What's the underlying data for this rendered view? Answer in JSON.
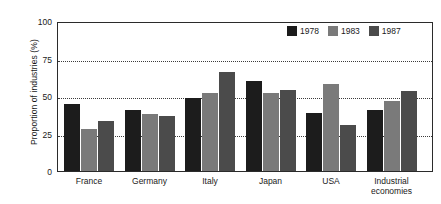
{
  "chart_data": {
    "type": "bar",
    "title": "",
    "xlabel": "",
    "ylabel": "Proportion of industries (%)",
    "ylim": [
      0,
      100
    ],
    "yticks": [
      0,
      25,
      50,
      75,
      100
    ],
    "ytick_labels": [
      "0",
      "25",
      "50",
      "75",
      "100"
    ],
    "grid": "horizontal dotted gridlines at 25, 50, 75",
    "legend_position": "top-right inside plot area",
    "categories": [
      "France",
      "Germany",
      "Italy",
      "Japan",
      "USA",
      "Industrial economies"
    ],
    "category_labels": [
      [
        "France"
      ],
      [
        "Germany"
      ],
      [
        "Italy"
      ],
      [
        "Japan"
      ],
      [
        "USA"
      ],
      [
        "Industrial",
        "economies"
      ]
    ],
    "series": [
      {
        "name": "1978",
        "color": "#1c1c1c",
        "values": [
          45,
          41,
          49.5,
          61,
          39,
          41
        ]
      },
      {
        "name": "1983",
        "color": "#7a7a7a",
        "values": [
          28.5,
          38.5,
          53,
          53,
          58.5,
          47
        ]
      },
      {
        "name": "1987",
        "color": "#4b4b4b",
        "values": [
          33.5,
          37,
          67,
          54.5,
          31,
          54
        ]
      }
    ]
  },
  "legend": {
    "entries": [
      {
        "label": "1978",
        "color": "#1c1c1c"
      },
      {
        "label": "1983",
        "color": "#7a7a7a"
      },
      {
        "label": "1987",
        "color": "#4b4b4b"
      }
    ]
  },
  "axis": {
    "y_title": "Proportion of industries (%)",
    "y_tick_0": "0",
    "y_tick_1": "25",
    "y_tick_2": "50",
    "y_tick_3": "75",
    "y_tick_4": "100"
  },
  "colors": {
    "frame": "#2b2b2b",
    "gridline": "#3b3b3b",
    "background": "#ffffff",
    "text": "#1a1a1a"
  }
}
